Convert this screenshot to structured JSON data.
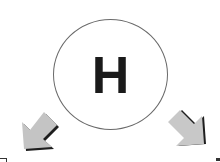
{
  "diagram": {
    "center_symbol": {
      "label": "H",
      "shape": "circle",
      "stroke_color": "#6a6a6a",
      "text_color": "#1a1a1a"
    },
    "arrows": [
      {
        "name": "left-arrow",
        "direction": "down-left",
        "fill": "#c4c4c4",
        "shadow": "#1e1e1e"
      },
      {
        "name": "right-arrow",
        "direction": "down-right",
        "fill": "#c4c4c4",
        "shadow": "#1e1e1e"
      }
    ]
  }
}
